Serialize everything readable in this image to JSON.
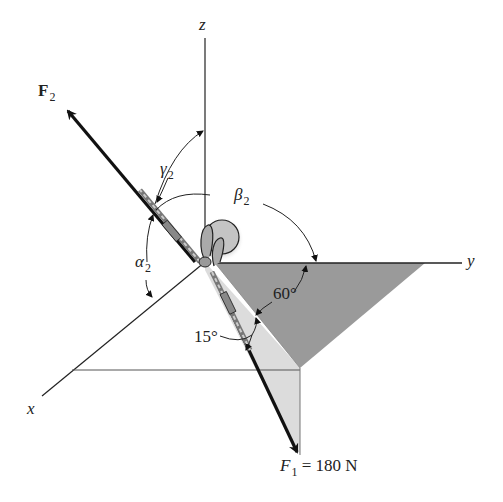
{
  "figure": {
    "type": "3D force vector diagram",
    "axes": {
      "x_label": "x",
      "y_label": "y",
      "z_label": "z"
    },
    "forces": {
      "F2": {
        "symbol": "F",
        "subscript": "2",
        "label_bold": true
      },
      "F1": {
        "symbol": "F",
        "subscript": "1",
        "equals": "=",
        "value": "180 N"
      }
    },
    "angles": {
      "alpha2": {
        "symbol": "α",
        "subscript": "2"
      },
      "beta2": {
        "symbol": "β",
        "subscript": "2"
      },
      "gamma2": {
        "symbol": "γ",
        "subscript": "2"
      },
      "angle_60": "60°",
      "angle_15": "15°"
    },
    "colors": {
      "dark_plane": "#9a9a9a",
      "light_plane": "#dcdcdc",
      "line": "#222222",
      "eyebolt": "#b8b8b8"
    }
  }
}
